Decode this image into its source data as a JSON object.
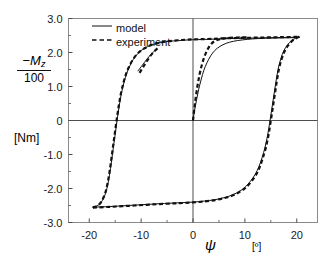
{
  "figure": {
    "title": "",
    "background": "#ffffff",
    "frame_color": "#8a8a8a",
    "axis_color": "#4d4d4d",
    "curve_color": "#111111"
  },
  "axes": {
    "y_axis_label_numerator": "−M",
    "y_axis_label_numerator_sub": "z",
    "y_axis_label_denominator": "100",
    "y_axis_unit": "[Nm]",
    "x_axis_label": "ψ",
    "x_axis_unit": "[º]"
  },
  "legend": {
    "position": "top-left-inside",
    "entries": [
      {
        "label": "model",
        "style": "solid"
      },
      {
        "label": "experiment",
        "style": "dashed"
      }
    ]
  },
  "ticks": {
    "y": [
      "3.0",
      "2.0",
      "1.0",
      "0",
      "-1.0",
      "-2.0",
      "-3.0"
    ],
    "x": [
      "-20",
      "-10",
      "0",
      "10",
      "20"
    ]
  },
  "chart_data": {
    "type": "line",
    "title": "",
    "xlabel": "ψ [º]",
    "ylabel": "-Mz/100 [Nm]",
    "xlim": [
      -24.0,
      24.0
    ],
    "ylim": [
      -3.0,
      3.0
    ],
    "xticks": [
      -20,
      -10,
      0,
      10,
      20
    ],
    "yticks": [
      3.0,
      2.0,
      1.0,
      0,
      -1.0,
      -2.0,
      -3.0
    ],
    "grid": false,
    "zero_lines": {
      "x": true,
      "y": true
    },
    "legend_position": "upper left",
    "series": [
      {
        "name": "model",
        "style": "solid",
        "color": "#111111",
        "width": 1.0,
        "branches": [
          {
            "name": "model-ascending-branch",
            "comment": "lower-left to upper-right, rising limb",
            "points": [
              [
                -19.3,
                -2.55
              ],
              [
                -18.6,
                -2.52
              ],
              [
                -18.0,
                -2.46
              ],
              [
                -17.5,
                -2.36
              ],
              [
                -17.0,
                -2.2
              ],
              [
                -16.6,
                -2.0
              ],
              [
                -16.2,
                -1.7
              ],
              [
                -15.8,
                -1.3
              ],
              [
                -15.4,
                -0.85
              ],
              [
                -15.0,
                -0.4
              ],
              [
                -14.6,
                0.05
              ],
              [
                -14.2,
                0.45
              ],
              [
                -13.8,
                0.8
              ],
              [
                -13.3,
                1.12
              ],
              [
                -12.8,
                1.38
              ],
              [
                -12.2,
                1.6
              ],
              [
                -11.5,
                1.8
              ],
              [
                -10.7,
                1.96
              ],
              [
                -9.8,
                2.08
              ],
              [
                -8.8,
                2.17
              ],
              [
                -7.6,
                2.24
              ],
              [
                -6.2,
                2.29
              ],
              [
                -4.6,
                2.33
              ],
              [
                -2.8,
                2.35
              ],
              [
                -1.0,
                2.37
              ],
              [
                1.0,
                2.38
              ],
              [
                3.5,
                2.39
              ],
              [
                6.5,
                2.41
              ],
              [
                10.0,
                2.42
              ],
              [
                13.5,
                2.43
              ],
              [
                17.0,
                2.44
              ],
              [
                20.5,
                2.45
              ]
            ]
          },
          {
            "name": "model-descending-branch",
            "comment": "upper-right to lower-left, falling limb",
            "points": [
              [
                20.5,
                2.45
              ],
              [
                19.8,
                2.42
              ],
              [
                19.0,
                2.35
              ],
              [
                18.2,
                2.22
              ],
              [
                17.5,
                2.05
              ],
              [
                16.9,
                1.8
              ],
              [
                16.4,
                1.5
              ],
              [
                16.0,
                1.15
              ],
              [
                15.6,
                0.75
              ],
              [
                15.2,
                0.35
              ],
              [
                14.8,
                -0.05
              ],
              [
                14.4,
                -0.42
              ],
              [
                13.9,
                -0.78
              ],
              [
                13.3,
                -1.1
              ],
              [
                12.7,
                -1.36
              ],
              [
                12.0,
                -1.58
              ],
              [
                11.1,
                -1.78
              ],
              [
                10.1,
                -1.95
              ],
              [
                9.0,
                -2.08
              ],
              [
                7.6,
                -2.19
              ],
              [
                6.0,
                -2.27
              ],
              [
                4.2,
                -2.33
              ],
              [
                2.2,
                -2.37
              ],
              [
                0.0,
                -2.4
              ],
              [
                -2.5,
                -2.42
              ],
              [
                -5.5,
                -2.44
              ],
              [
                -9.0,
                -2.47
              ],
              [
                -12.5,
                -2.5
              ],
              [
                -16.0,
                -2.53
              ],
              [
                -19.3,
                -2.55
              ]
            ]
          },
          {
            "name": "model-inner-branch-from-origin",
            "comment": "minor reversal curve starting at origin going up-right",
            "points": [
              [
                0.0,
                0.0
              ],
              [
                0.3,
                0.3
              ],
              [
                0.7,
                0.62
              ],
              [
                1.1,
                0.92
              ],
              [
                1.6,
                1.22
              ],
              [
                2.1,
                1.48
              ],
              [
                2.7,
                1.7
              ],
              [
                3.4,
                1.9
              ],
              [
                4.2,
                2.06
              ],
              [
                5.2,
                2.18
              ],
              [
                6.4,
                2.27
              ],
              [
                7.8,
                2.33
              ],
              [
                9.5,
                2.37
              ],
              [
                11.5,
                2.4
              ],
              [
                14.0,
                2.42
              ],
              [
                17.0,
                2.43
              ],
              [
                20.3,
                2.44
              ]
            ]
          },
          {
            "name": "model-inner-branch-left",
            "comment": "small minor reversal segment on the left ascending limb near psi=-8",
            "points": [
              [
                -10.6,
                1.46
              ],
              [
                -10.0,
                1.58
              ],
              [
                -9.4,
                1.7
              ],
              [
                -8.8,
                1.82
              ],
              [
                -8.2,
                1.93
              ],
              [
                -7.6,
                2.02
              ],
              [
                -7.0,
                2.1
              ]
            ]
          }
        ]
      },
      {
        "name": "experiment",
        "style": "dashed",
        "color": "#111111",
        "width": 2.2,
        "branches": [
          {
            "name": "experiment-ascending-branch",
            "points": [
              [
                -19.3,
                -2.55
              ],
              [
                -18.7,
                -2.53
              ],
              [
                -18.1,
                -2.47
              ],
              [
                -17.6,
                -2.37
              ],
              [
                -17.1,
                -2.21
              ],
              [
                -16.7,
                -2.01
              ],
              [
                -16.3,
                -1.71
              ],
              [
                -15.9,
                -1.31
              ],
              [
                -15.5,
                -0.86
              ],
              [
                -15.1,
                -0.41
              ],
              [
                -14.7,
                0.04
              ],
              [
                -14.3,
                0.44
              ],
              [
                -13.9,
                0.79
              ],
              [
                -13.4,
                1.11
              ],
              [
                -12.9,
                1.37
              ],
              [
                -12.3,
                1.59
              ],
              [
                -11.6,
                1.79
              ],
              [
                -10.8,
                1.95
              ],
              [
                -9.9,
                2.07
              ],
              [
                -8.9,
                2.16
              ],
              [
                -7.7,
                2.24
              ],
              [
                -6.3,
                2.29
              ],
              [
                -4.7,
                2.33
              ],
              [
                -2.9,
                2.36
              ],
              [
                -1.0,
                2.38
              ],
              [
                1.0,
                2.39
              ],
              [
                3.5,
                2.4
              ],
              [
                6.5,
                2.42
              ],
              [
                10.0,
                2.43
              ],
              [
                13.5,
                2.44
              ],
              [
                17.0,
                2.45
              ],
              [
                20.5,
                2.46
              ]
            ]
          },
          {
            "name": "experiment-descending-branch",
            "points": [
              [
                20.5,
                2.46
              ],
              [
                19.9,
                2.42
              ],
              [
                19.1,
                2.34
              ],
              [
                18.3,
                2.2
              ],
              [
                17.6,
                2.02
              ],
              [
                17.0,
                1.77
              ],
              [
                16.5,
                1.46
              ],
              [
                16.1,
                1.1
              ],
              [
                15.7,
                0.7
              ],
              [
                15.3,
                0.3
              ],
              [
                14.9,
                -0.1
              ],
              [
                14.5,
                -0.47
              ],
              [
                14.0,
                -0.82
              ],
              [
                13.4,
                -1.13
              ],
              [
                12.8,
                -1.39
              ],
              [
                12.1,
                -1.61
              ],
              [
                11.2,
                -1.8
              ],
              [
                10.2,
                -1.97
              ],
              [
                9.1,
                -2.09
              ],
              [
                7.7,
                -2.2
              ],
              [
                6.1,
                -2.28
              ],
              [
                4.3,
                -2.34
              ],
              [
                2.3,
                -2.38
              ],
              [
                0.0,
                -2.41
              ],
              [
                -2.5,
                -2.43
              ],
              [
                -5.5,
                -2.45
              ],
              [
                -9.0,
                -2.48
              ],
              [
                -12.5,
                -2.51
              ],
              [
                -16.0,
                -2.54
              ],
              [
                -19.3,
                -2.56
              ]
            ]
          },
          {
            "name": "experiment-inner-branch-from-origin",
            "points": [
              [
                0.0,
                0.0
              ],
              [
                0.25,
                0.34
              ],
              [
                0.55,
                0.7
              ],
              [
                0.9,
                1.05
              ],
              [
                1.3,
                1.38
              ],
              [
                1.75,
                1.66
              ],
              [
                2.25,
                1.9
              ],
              [
                2.85,
                2.1
              ],
              [
                3.55,
                2.26
              ],
              [
                4.4,
                2.35
              ],
              [
                5.5,
                2.4
              ],
              [
                6.9,
                2.43
              ],
              [
                8.6,
                2.44
              ],
              [
                10.8,
                2.45
              ]
            ]
          },
          {
            "name": "experiment-inner-branch-left",
            "points": [
              [
                -10.3,
                1.4
              ],
              [
                -9.7,
                1.55
              ],
              [
                -9.1,
                1.7
              ],
              [
                -8.5,
                1.84
              ],
              [
                -7.9,
                1.96
              ],
              [
                -7.3,
                2.06
              ],
              [
                -6.7,
                2.14
              ]
            ]
          }
        ]
      }
    ]
  }
}
